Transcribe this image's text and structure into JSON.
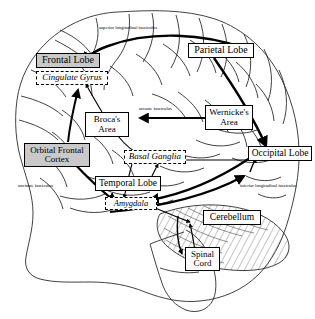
{
  "figure": {
    "background_color": "#ffffff",
    "outline_color": "#000000",
    "node_fill_gray": "#c9c9c9",
    "node_fill_white": "#ffffff"
  },
  "nodes": {
    "frontal_lobe": {
      "label": "Frontal Lobe",
      "style": "filled"
    },
    "cingulate_gyrus": {
      "label": "Cingulate Gyrus",
      "style": "dashed"
    },
    "orbital_frontal_cortex_line1": "Orbital Frontal",
    "orbital_frontal_cortex_line2": "Cortex",
    "brocas_area_line1": "Broca's",
    "brocas_area_line2": "Area",
    "parietal_lobe": {
      "label": "Parietal Lobe",
      "style": "solid"
    },
    "wernickes_area_line1": "Wernicke's",
    "wernickes_area_line2": "Area",
    "occipital_lobe": {
      "label": "Occipital Lobe",
      "style": "solid"
    },
    "basal_ganglia": {
      "label": "Basal Ganglia",
      "style": "dashed"
    },
    "temporal_lobe": {
      "label": "Temporal Lobe",
      "style": "solid"
    },
    "amygdala": {
      "label": "Amygdala",
      "style": "dashed"
    },
    "cerebellum": {
      "label": "Cerebellum",
      "style": "solid"
    },
    "spinal_cord_line1": "Spinal",
    "spinal_cord_line2": "Cord"
  },
  "tract_labels": {
    "superior_longitudinal": "superior longitudinal fasciculus",
    "arcuate": "arcuate fasciculus",
    "uncinate": "uncinate fasciculus",
    "inferior_longitudinal_line1": "inferior longitudinal",
    "inferior_longitudinal_line2": "fasciculus"
  }
}
